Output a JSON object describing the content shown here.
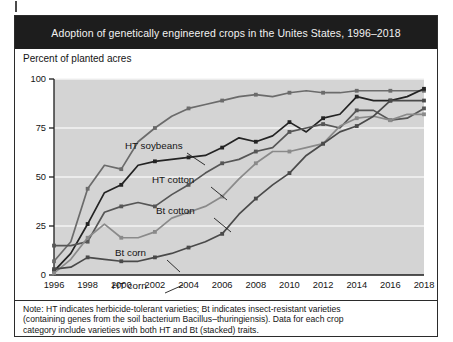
{
  "figure": {
    "title": "Adoption of genetically engineered crops in the Unites States, 1996–2018",
    "y_axis_caption": "Percent of planted acres",
    "note_lines": [
      "Note: HT indicates herbicide-tolerant varieties; Bt indicates insect-resistant varieties",
      "(containing genes from the soil bacterium Bacillus–thuringiensis). Data for each crop",
      "category include varieties with both HT and Bt (stacked) traits."
    ],
    "title_bg": "#1d1d1d",
    "title_fg": "#f2f2f2",
    "plot_bg": "#d4d4d4",
    "frame_color": "#2b2b2b"
  },
  "chart_data": {
    "type": "line",
    "title": "Adoption of genetically engineered crops in the Unites States, 1996–2018",
    "xlabel": "",
    "ylabel": "Percent of planted acres",
    "xlim": [
      1996,
      2018
    ],
    "ylim": [
      0,
      100
    ],
    "yticks": [
      0,
      25,
      50,
      75,
      100
    ],
    "xticks": [
      1996,
      1998,
      2000,
      2002,
      2004,
      2006,
      2008,
      2010,
      2012,
      2014,
      2016,
      2018
    ],
    "grid": true,
    "legend": "inline-annotations",
    "x": [
      1996,
      1997,
      1998,
      1999,
      2000,
      2001,
      2002,
      2003,
      2004,
      2005,
      2006,
      2007,
      2008,
      2009,
      2010,
      2011,
      2012,
      2013,
      2014,
      2015,
      2016,
      2017,
      2018
    ],
    "series": [
      {
        "name": "HT soybeans",
        "color": "#6b6b6b",
        "values": [
          7,
          17,
          44,
          56,
          54,
          68,
          75,
          81,
          85,
          87,
          89,
          91,
          92,
          91,
          93,
          94,
          93,
          93,
          94,
          94,
          94,
          94,
          94
        ]
      },
      {
        "name": "HT cotton",
        "color": "#232323",
        "values": [
          2,
          11,
          26,
          42,
          46,
          56,
          58,
          59,
          60,
          61,
          65,
          70,
          68,
          71,
          78,
          73,
          80,
          82,
          91,
          89,
          89,
          91,
          95
        ]
      },
      {
        "name": "Bt cotton",
        "color": "#565656",
        "values": [
          15,
          15,
          17,
          32,
          35,
          37,
          35,
          41,
          46,
          52,
          57,
          59,
          63,
          65,
          73,
          75,
          77,
          75,
          84,
          84,
          79,
          80,
          85
        ]
      },
      {
        "name": "Bt corn",
        "color": "#8a8a8a",
        "values": [
          1,
          8,
          19,
          26,
          19,
          19,
          22,
          29,
          32,
          35,
          40,
          49,
          57,
          63,
          63,
          65,
          67,
          76,
          80,
          81,
          79,
          82,
          82
        ]
      },
      {
        "name": "HT corn",
        "color": "#4a4a4a",
        "values": [
          3,
          4,
          9,
          8,
          7,
          7,
          9,
          11,
          14,
          17,
          21,
          31,
          39,
          46,
          52,
          61,
          67,
          73,
          76,
          81,
          89,
          89,
          89
        ]
      }
    ],
    "annotations": [
      {
        "text": "HT soybeans",
        "x_px": 110,
        "y_px": 100
      },
      {
        "text": "HT cotton",
        "x_px": 137,
        "y_px": 134
      },
      {
        "text": "Bt cotton",
        "x_px": 141,
        "y_px": 165
      },
      {
        "text": "Bt corn",
        "x_px": 100,
        "y_px": 207
      },
      {
        "text": "HT corn",
        "x_px": 97,
        "y_px": 240
      }
    ]
  }
}
